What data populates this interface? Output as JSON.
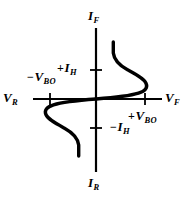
{
  "figure": {
    "width": 193,
    "height": 197,
    "background_color": "#ffffff",
    "ink_color": "#000000"
  },
  "labels": {
    "forward_current": {
      "symbol": "I",
      "subscript": "F",
      "sign": "",
      "text": "IF"
    },
    "reverse_current": {
      "symbol": "I",
      "subscript": "R",
      "sign": "",
      "text": "IR"
    },
    "reverse_voltage": {
      "symbol": "V",
      "subscript": "R",
      "sign": "",
      "text": "VR"
    },
    "forward_voltage": {
      "symbol": "V",
      "subscript": "F",
      "sign": "",
      "text": "VF"
    },
    "neg_breakover_voltage": {
      "symbol": "V",
      "subscript": "BO",
      "sign": "−",
      "text": "-VBO"
    },
    "pos_breakover_voltage": {
      "symbol": "V",
      "subscript": "BO",
      "sign": "+",
      "text": "+VBO"
    },
    "pos_holding_current": {
      "symbol": "I",
      "subscript": "H",
      "sign": "+",
      "text": "+IH"
    },
    "neg_holding_current": {
      "symbol": "I",
      "subscript": "H",
      "sign": "−",
      "text": "-IH"
    }
  },
  "chart_data": {
    "type": "line",
    "title": "",
    "xlabel": "V",
    "ylabel": "I",
    "grid": false,
    "legend": false,
    "axes": {
      "origin": {
        "x": 96,
        "y": 99
      },
      "vertical_axis": {
        "x": 96,
        "y_top": 28,
        "y_bottom": 172,
        "label_top": "IF",
        "label_bottom": "IR"
      },
      "horizontal_axis": {
        "y": 99,
        "x_left": 33,
        "x_right": 162,
        "label_left": "VR",
        "label_right": "VF"
      },
      "ticks": [
        {
          "name": "-VBO",
          "axis": "x",
          "x": 50,
          "y": 99
        },
        {
          "name": "+VBO",
          "axis": "x",
          "x": 145,
          "y": 99
        },
        {
          "name": "+IH",
          "axis": "y",
          "x": 96,
          "y": 70
        },
        {
          "name": "-IH",
          "axis": "y",
          "x": 96,
          "y": 128
        }
      ]
    },
    "series": [
      {
        "name": "forward-quadrant-characteristic",
        "description": "Blocking region rises along V axis to breakover at +VBO, then negative-resistance snapback to holding current +IH, then steep conduction rise.",
        "points": [
          {
            "x": 96,
            "y": 99
          },
          {
            "x": 118,
            "y": 97
          },
          {
            "x": 134,
            "y": 94
          },
          {
            "x": 143,
            "y": 90
          },
          {
            "x": 146,
            "y": 85
          },
          {
            "x": 144,
            "y": 79
          },
          {
            "x": 136,
            "y": 73
          },
          {
            "x": 125,
            "y": 67
          },
          {
            "x": 117,
            "y": 60
          },
          {
            "x": 113,
            "y": 52
          },
          {
            "x": 113,
            "y": 42
          }
        ]
      },
      {
        "name": "reverse-quadrant-characteristic",
        "description": "Mirror-image of forward branch through the origin: blocking region to -VBO, snapback to -IH, then steep reverse conduction.",
        "points": [
          {
            "x": 96,
            "y": 99
          },
          {
            "x": 74,
            "y": 101
          },
          {
            "x": 58,
            "y": 104
          },
          {
            "x": 49,
            "y": 108
          },
          {
            "x": 46,
            "y": 113
          },
          {
            "x": 48,
            "y": 119
          },
          {
            "x": 56,
            "y": 125
          },
          {
            "x": 67,
            "y": 131
          },
          {
            "x": 75,
            "y": 138
          },
          {
            "x": 79,
            "y": 146
          },
          {
            "x": 79,
            "y": 156
          }
        ]
      }
    ]
  }
}
